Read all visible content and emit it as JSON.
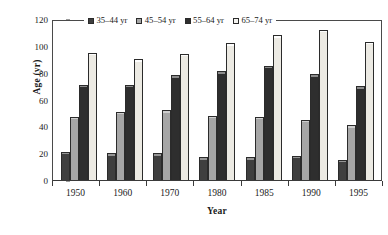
{
  "chart_data": {
    "type": "bar",
    "title": "",
    "xlabel": "Year",
    "ylabel": "Age (yr)",
    "categories": [
      "1950",
      "1960",
      "1970",
      "1980",
      "1985",
      "1990",
      "1995"
    ],
    "series": [
      {
        "name": "35–44 yr",
        "color": "#3f3f3f",
        "values": [
          21,
          20,
          20,
          17,
          17,
          18,
          15
        ]
      },
      {
        "name": "45–54 yr",
        "color": "#a6a6a6",
        "values": [
          47,
          51,
          52,
          48,
          47,
          45,
          41
        ]
      },
      {
        "name": "55–64 yr",
        "color": "#2e2e2e",
        "values": [
          71,
          71,
          78,
          81,
          85,
          79,
          70
        ]
      },
      {
        "name": "65–74 yr",
        "color": "#eceae3",
        "values": [
          95,
          90,
          94,
          102,
          108,
          112,
          103
        ]
      }
    ],
    "ylim": [
      0,
      120
    ],
    "yticks": [
      0,
      20,
      40,
      60,
      80,
      100,
      120
    ],
    "ytick_labels": [
      "0",
      "20",
      "40",
      "60",
      "80",
      "100",
      "120"
    ],
    "grid": false,
    "legend_position": "top-center"
  }
}
